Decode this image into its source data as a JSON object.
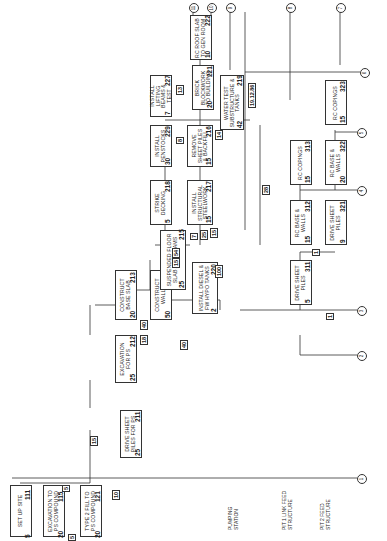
{
  "diagram": {
    "type": "activity-on-node network (rotated 90° CCW)",
    "sections": [
      {
        "label": "PUMPING STATION"
      },
      {
        "label": "PIT 1 LINK FEED STRUCTURE"
      },
      {
        "label": "PIT 2 FEED STRUCTURE"
      }
    ],
    "activities": [
      {
        "id": "111",
        "label": "SET UP SITE",
        "duration": "5"
      },
      {
        "id": "115",
        "label": "EXCAVATION TO PS COMPOUND",
        "duration": "20"
      },
      {
        "id": "121",
        "label": "TYPE 2 FILL TO PS COMPOUND",
        "duration": "20"
      },
      {
        "id": "211",
        "label": "DRIVE SHEET PILES FOR PS",
        "duration": "25"
      },
      {
        "id": "212",
        "label": "EXCAVATION FOR PS",
        "duration": "25"
      },
      {
        "id": "213",
        "label": "CONSTRUCT BASE SLAB",
        "duration": "20"
      },
      {
        "id": "214",
        "label": "CONSTRUCT WALLS",
        "duration": "50"
      },
      {
        "id": "215",
        "label": "SUSPENDED FLOOR SLAB AND BEAMS",
        "duration": "25"
      },
      {
        "id": "220",
        "label": "INSTALL DIESEL & Fw HYPO TANKS",
        "duration": "2"
      },
      {
        "id": "218",
        "label": "STRIKE DECKING",
        "duration": "5"
      },
      {
        "id": "217",
        "label": "INSTALL STRUCTURAL STEELWORK",
        "duration": "15"
      },
      {
        "id": "229",
        "label": "INSTALL PENSTOCKS",
        "duration": "30"
      },
      {
        "id": "216",
        "label": "REMOVE SHEET PILES & BACKFILL",
        "duration": "15"
      },
      {
        "id": "227",
        "label": "INSTALL LIFTING BEAMS & TEST",
        "duration": "7"
      },
      {
        "id": "221",
        "label": "BRICK BLOCKWORK TO BUILDING",
        "duration": "20"
      },
      {
        "id": "219",
        "label": "WATER TEST SUBSTRUCTURE & TANKS",
        "duration": "42"
      },
      {
        "id": "222",
        "label": "RC ROOF SLAB TO GEN ROOM",
        "duration": "10"
      },
      {
        "id": "311",
        "label": "DRIVE SHEET PILES",
        "duration": "5"
      },
      {
        "id": "312",
        "label": "RC BASE & WALLS",
        "duration": "15"
      },
      {
        "id": "313",
        "label": "RC COPINGS",
        "duration": "15"
      },
      {
        "id": "321",
        "label": "DRIVE SHEET PILES",
        "duration": "9"
      },
      {
        "id": "322",
        "label": "RC BASE & WALLS",
        "duration": "20"
      },
      {
        "id": "323",
        "label": "RC COPINGS",
        "duration": "15"
      }
    ],
    "floats": [
      "5",
      "5",
      "10",
      "15",
      "18",
      "40",
      "40",
      "15",
      "54",
      "15",
      "25",
      "28",
      "13",
      "14",
      "8",
      "7",
      "100",
      "1",
      "1"
    ],
    "date_note": "19.12.86",
    "connectors": [
      "1",
      "2",
      "3",
      "4",
      "5",
      "6",
      "7",
      "8",
      "9",
      "10",
      "11"
    ]
  }
}
